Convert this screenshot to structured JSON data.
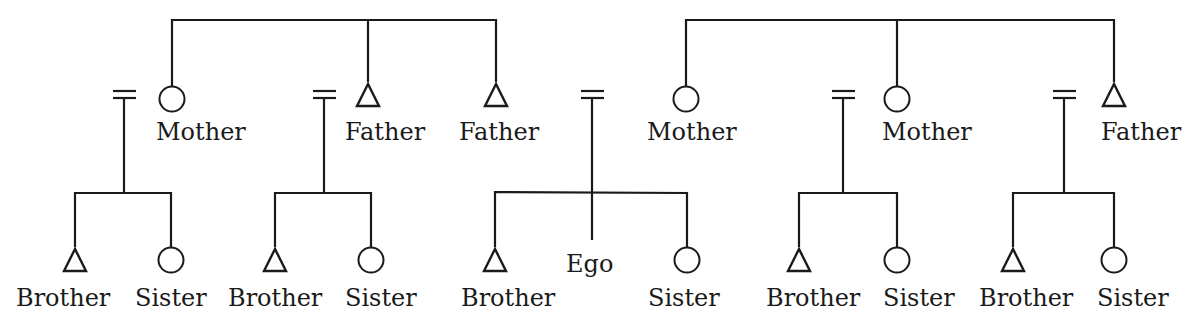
{
  "diagram": {
    "type": "kinship-chart",
    "colors": {
      "line": "#1a1a1a",
      "background": "#ffffff"
    },
    "symbol_legend": {
      "triangle": "male",
      "circle": "female",
      "double-bar": "marriage"
    },
    "parent_generation": {
      "left_sibling_group": [
        {
          "id": "p1",
          "label": "Mother",
          "sex": "female"
        },
        {
          "id": "p2",
          "label": "Father",
          "sex": "male"
        },
        {
          "id": "p3",
          "label": "Father",
          "sex": "male"
        }
      ],
      "right_sibling_group": [
        {
          "id": "p4",
          "label": "Mother",
          "sex": "female"
        },
        {
          "id": "p5",
          "label": "Mother",
          "sex": "female"
        },
        {
          "id": "p6",
          "label": "Father",
          "sex": "male"
        }
      ]
    },
    "child_generation": [
      {
        "family": 1,
        "members": [
          {
            "label": "Brother",
            "sex": "male"
          },
          {
            "label": "Sister",
            "sex": "female"
          }
        ]
      },
      {
        "family": 2,
        "members": [
          {
            "label": "Brother",
            "sex": "male"
          },
          {
            "label": "Sister",
            "sex": "female"
          }
        ]
      },
      {
        "family": 3,
        "members": [
          {
            "label": "Brother",
            "sex": "male"
          },
          {
            "label": "Ego",
            "sex": "ego"
          },
          {
            "label": "Sister",
            "sex": "female"
          }
        ]
      },
      {
        "family": 4,
        "members": [
          {
            "label": "Brother",
            "sex": "male"
          },
          {
            "label": "Sister",
            "sex": "female"
          }
        ]
      },
      {
        "family": 5,
        "members": [
          {
            "label": "Brother",
            "sex": "male"
          },
          {
            "label": "Sister",
            "sex": "female"
          }
        ]
      }
    ]
  }
}
